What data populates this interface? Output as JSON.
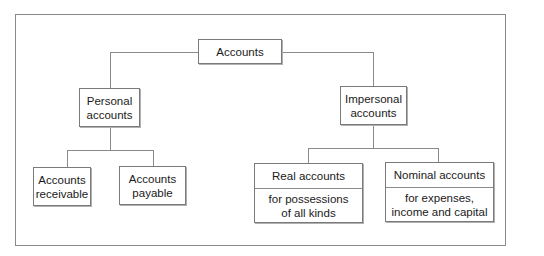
{
  "diagram": {
    "root": {
      "label": "Accounts"
    },
    "personal": {
      "label": "Personal\naccounts"
    },
    "impersonal": {
      "label": "Impersonal\naccounts"
    },
    "receivable": {
      "label": "Accounts\nreceivable"
    },
    "payable": {
      "label": "Accounts\npayable"
    },
    "real": {
      "title": "Real accounts",
      "description": "for possessions\nof all kinds"
    },
    "nominal": {
      "title": "Nominal accounts",
      "description": "for expenses,\nincome and capital"
    }
  },
  "colors": {
    "border": "#7a7a7a",
    "line": "#8a8a8a",
    "text": "#1a1a1a",
    "background": "#ffffff"
  }
}
